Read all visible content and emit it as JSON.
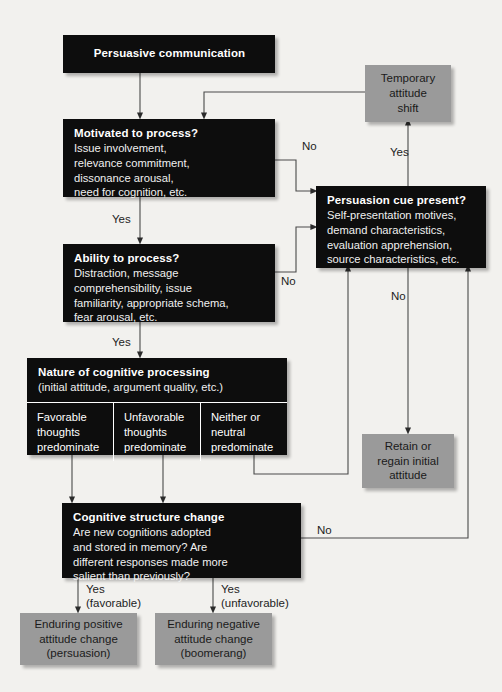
{
  "diagram": {
    "colors": {
      "background": "#f2f1ee",
      "dark_box": "#0d0d0d",
      "gray_box": "#9a9a9a",
      "line": "#4a4a4a",
      "text_on_dark": "#ffffff",
      "text_on_gray": "#1a1a1a"
    }
  },
  "nodes": {
    "persuasive_communication": {
      "title": "Persuasive communication"
    },
    "motivated": {
      "title": "Motivated to process?",
      "detail": "Issue involvement,\nrelevance commitment,\ndissonance arousal,\nneed for cognition, etc."
    },
    "ability": {
      "title": "Ability to process?",
      "detail": "Distraction, message\ncomprehensibility, issue\nfamiliarity, appropriate schema,\nfear arousal, etc."
    },
    "cue": {
      "title": "Persuasion cue present?",
      "detail": "Self-presentation motives,\ndemand characteristics,\nevaluation apprehension,\nsource characteristics, etc."
    },
    "temporary": {
      "label": "Temporary\nattitude\nshift"
    },
    "retain": {
      "label": "Retain or\nregain initial\nattitude"
    },
    "nature": {
      "title": "Nature of cognitive processing",
      "subtitle": "(initial attitude, argument quality, etc.)",
      "columns": [
        "Favorable\nthoughts\npredominate",
        "Unfavorable\nthoughts\npredominate",
        "Neither or\nneutral\npredominate"
      ]
    },
    "structure_change": {
      "title": "Cognitive structure change",
      "detail": "Are new cognitions adopted\nand stored in memory? Are\ndifferent responses made more\nsalient than previously?"
    },
    "positive_outcome": {
      "label": "Enduring positive\nattitude change\n(persuasion)"
    },
    "negative_outcome": {
      "label": "Enduring negative\nattitude change\n(boomerang)"
    }
  },
  "edge_labels": {
    "motivated_no": "No",
    "motivated_yes": "Yes",
    "ability_no": "No",
    "ability_yes": "Yes",
    "cue_yes": "Yes",
    "cue_no": "No",
    "structure_no": "No",
    "yes_favorable": "Yes\n(favorable)",
    "yes_unfavorable": "Yes\n(unfavorable)"
  }
}
